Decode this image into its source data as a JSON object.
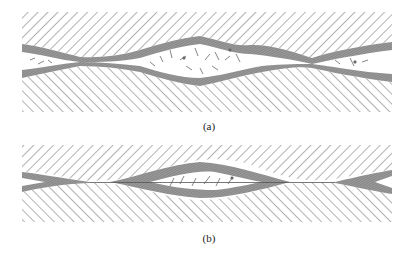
{
  "figure": {
    "panels": [
      {
        "id": "a",
        "label": "(a)",
        "description": "Two thick layers separating with a lens-shaped cavity filled with fragments"
      },
      {
        "id": "b",
        "label": "(b)",
        "description": "Layers pinching to a thin contact with smaller lens cavity"
      }
    ],
    "colors": {
      "hatch": "#555555",
      "layer_fill": "#8a8a8a",
      "background": "#ffffff"
    }
  }
}
